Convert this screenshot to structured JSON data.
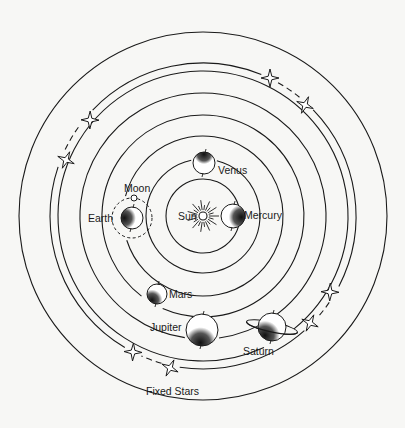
{
  "colors": {
    "background": "#f7f7f5",
    "ink": "#1a1a1a",
    "planet_fill": "#ffffff",
    "planet_shadow": "#2a2a2a"
  },
  "center": {
    "x": 203,
    "y": 216
  },
  "sun": {
    "label": "Sun",
    "radius": 4
  },
  "orbits": [
    {
      "name": "mercury-orbit",
      "radius": 37
    },
    {
      "name": "venus-orbit",
      "radius": 57
    },
    {
      "name": "earth-orbit",
      "radius": 80
    },
    {
      "name": "mars-orbit",
      "radius": 101
    },
    {
      "name": "jupiter-orbit",
      "radius": 123
    },
    {
      "name": "saturn-orbit",
      "radius": 145
    },
    {
      "name": "fixed-stars-sphere",
      "radius": 153
    },
    {
      "name": "outer-boundary",
      "radius": 184
    }
  ],
  "bodies": {
    "mercury": {
      "label": "Mercury",
      "cx": 233,
      "cy": 216,
      "r": 12
    },
    "venus": {
      "label": "Venus",
      "cx": 204,
      "cy": 163,
      "r": 11
    },
    "earth": {
      "label": "Earth",
      "cx": 132,
      "cy": 218,
      "r": 11
    },
    "moon": {
      "label": "Moon",
      "cx": 134,
      "cy": 198,
      "r": 3
    },
    "mars": {
      "label": "Mars",
      "cx": 157,
      "cy": 294,
      "r": 10
    },
    "jupiter": {
      "label": "Jupiter",
      "cx": 202,
      "cy": 330,
      "r": 16
    },
    "saturn": {
      "label": "Saturn",
      "cx": 272,
      "cy": 327,
      "r": 14
    }
  },
  "fixed_stars": {
    "label": "Fixed Stars",
    "positions": [
      {
        "x": 270,
        "y": 78
      },
      {
        "x": 305,
        "y": 105
      },
      {
        "x": 90,
        "y": 120
      },
      {
        "x": 66,
        "y": 160
      },
      {
        "x": 330,
        "y": 292
      },
      {
        "x": 310,
        "y": 323
      },
      {
        "x": 133,
        "y": 352
      },
      {
        "x": 170,
        "y": 368
      }
    ]
  }
}
